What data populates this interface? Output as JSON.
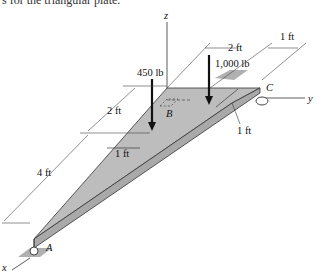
{
  "caption_fragment": "s for the triangular plate.",
  "axes": {
    "x": "x",
    "y": "y",
    "z": "z"
  },
  "points": {
    "A": "A",
    "B": "B",
    "C": "C"
  },
  "loads": [
    {
      "label": "450 lb"
    },
    {
      "label": "1,000 lb"
    }
  ],
  "dimensions": {
    "d_2ft_left": "2 ft",
    "d_4ft": "4 ft",
    "d_1ft_inner": "1 ft",
    "d_2ft_top": "2 ft",
    "d_1ft_top": "1 ft",
    "d_1ft_right": "1 ft"
  },
  "colors": {
    "plate": "#b9b9b9",
    "plate_edge": "#9a9a9a",
    "line": "#222222"
  }
}
